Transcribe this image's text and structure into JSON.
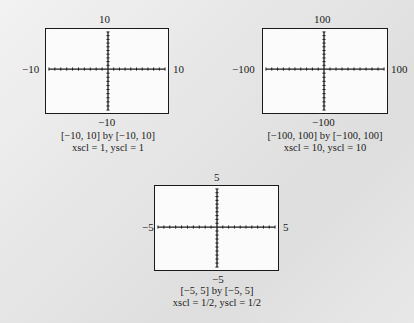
{
  "chart_data": [
    {
      "type": "line",
      "title": "[−10, 10] by [−10, 10]",
      "subtitle": "xscl = 1, yscl = 1",
      "xlim": [
        -10,
        10
      ],
      "ylim": [
        -10,
        10
      ],
      "xscl": 1,
      "yscl": 1,
      "labels": {
        "top": "10",
        "bottom": "−10",
        "left": "−10",
        "right": "10"
      },
      "ticks_per_half_axis": 10
    },
    {
      "type": "line",
      "title": "[−100, 100] by [−100, 100]",
      "subtitle": "xscl = 10, yscl = 10",
      "xlim": [
        -100,
        100
      ],
      "ylim": [
        -100,
        100
      ],
      "xscl": 10,
      "yscl": 10,
      "labels": {
        "top": "100",
        "bottom": "−100",
        "left": "−100",
        "right": "100"
      },
      "ticks_per_half_axis": 10
    },
    {
      "type": "line",
      "title": "[−5, 5] by [−5, 5]",
      "subtitle": "xscl = 1/2,  yscl = 1/2",
      "xlim": [
        -5,
        5
      ],
      "ylim": [
        -5,
        5
      ],
      "xscl": 0.5,
      "yscl": 0.5,
      "labels": {
        "top": "5",
        "bottom": "−5",
        "left": "−5",
        "right": "5"
      },
      "ticks_per_half_axis": 10
    }
  ],
  "colors": {
    "axis": "#1a1a1a",
    "screen": "#fbfbfb",
    "background": "#e4e4e4"
  }
}
